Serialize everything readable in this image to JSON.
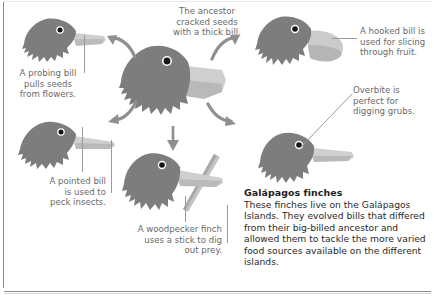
{
  "diagram": {
    "colors": {
      "body": "#7d7d7d",
      "body_dark": "#6e6e6e",
      "beak_light": "#c9c9c9",
      "beak_lighter": "#d9d9d9",
      "eye": "#1a1a1a",
      "eye_ring": "#ffffff",
      "caption_text": "#6a6a6a",
      "body_text": "#2a2a2a",
      "heading_text": "#1c1c1c",
      "leader_line": "#9a9a9a",
      "arrow": "#8f8f8f",
      "frame": "#8a8a8a"
    }
  },
  "captions": {
    "ancestor": "The ancestor\ncracked seeds\nwith a thick bill.",
    "probing": "A probing bill\npulls seeds\nfrom flowers.",
    "pointed": "A pointed bill\nis used to\npeck insects.",
    "woodpecker": "A woodpecker finch\nuses a stick to dig\nout prey.",
    "hooked": "A hooked bill is\nused for slicing\nthrough fruit.",
    "overbite": "Overbite is\nperfect for\ndigging grubs."
  },
  "info": {
    "heading": "Galápagos finches",
    "body": "These finches live on the Galápagos Islands. They evolved bills that differed from their big-billed ancestor and allowed them to tackle the more varied food sources available on the different islands."
  },
  "birds": [
    {
      "id": "ancestor",
      "label": "ancestor-finch-thick-bill"
    },
    {
      "id": "probing",
      "label": "probing-bill-finch"
    },
    {
      "id": "pointed",
      "label": "pointed-bill-finch"
    },
    {
      "id": "woodpecker",
      "label": "woodpecker-finch"
    },
    {
      "id": "hooked",
      "label": "hooked-bill-finch"
    },
    {
      "id": "overbite",
      "label": "overbite-finch"
    }
  ],
  "arrows": [
    {
      "id": "to-probing",
      "direction": "up-left"
    },
    {
      "id": "to-hooked",
      "direction": "up-right"
    },
    {
      "id": "to-pointed",
      "direction": "down-left"
    },
    {
      "id": "to-overbite",
      "direction": "down-right"
    },
    {
      "id": "to-woodpecker",
      "direction": "down"
    }
  ]
}
